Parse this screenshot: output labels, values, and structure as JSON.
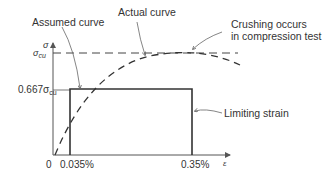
{
  "diagram": {
    "annotations": {
      "assumed_curve": "Assumed curve",
      "actual_curve": "Actual curve",
      "crushing_line1": "Crushing occurs",
      "crushing_line2": "in compression test",
      "limiting_strain": "Limiting strain"
    },
    "axes": {
      "y_symbol": "σ",
      "x_symbol": "ε",
      "y_ticks": {
        "sigma_cu": "σ",
        "sigma_cu_sub": "cu",
        "coef": "0.667σ",
        "coef_sub": "cu"
      },
      "x_ticks": {
        "origin": "0",
        "strain_start": "0.035%",
        "strain_limit": "0.35%"
      }
    },
    "colors": {
      "line": "#444444",
      "text": "#333333",
      "arrow": "#777777"
    }
  }
}
